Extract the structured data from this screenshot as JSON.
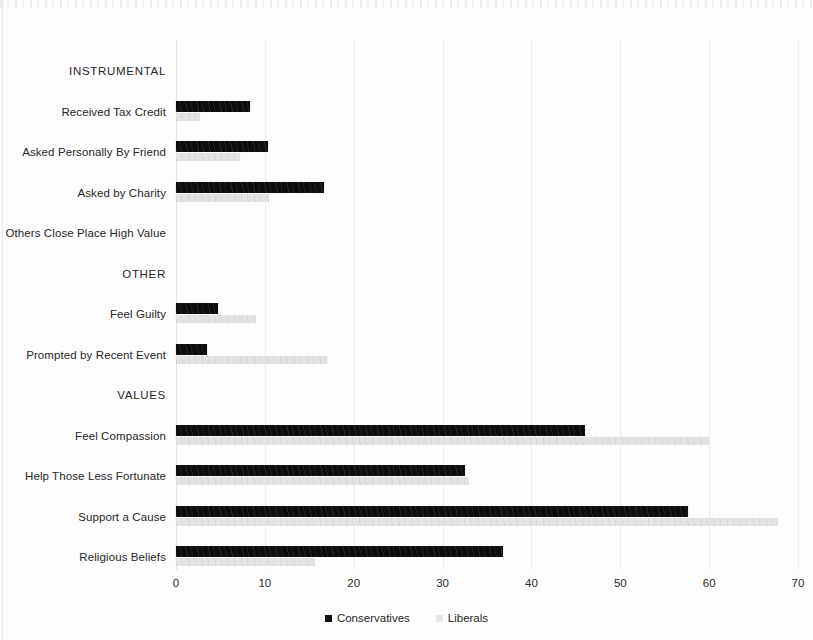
{
  "chart_data": {
    "type": "bar",
    "orientation": "horizontal",
    "title": "",
    "subtitle": "",
    "xlabel": "",
    "ylabel": "",
    "xlim": [
      0,
      70
    ],
    "xticks": [
      0,
      10,
      20,
      30,
      40,
      50,
      60,
      70
    ],
    "xtick_labels": [
      "0",
      "10",
      "20",
      "30",
      "40",
      "50",
      "60",
      "70"
    ],
    "grid": true,
    "grid_axis": "x",
    "legend_position": "bottom-center",
    "legend": [
      "Conservatives",
      "Liberals"
    ],
    "colors": {
      "conservatives": "#0d0d0d",
      "liberals": "#e3e3e3",
      "gridline": "#ededed",
      "text": "#262626",
      "background": "#fdfdfd"
    },
    "categories": [
      "INSTRUMENTAL",
      "Received Tax Credit",
      "Asked Personally By Friend",
      "Asked by Charity",
      "Others Close Place High Value",
      "OTHER",
      "Feel Guilty",
      "Prompted by Recent Event",
      "VALUES",
      "Feel Compassion",
      "Help Those Less Fortunate",
      "Support a Cause",
      "Religious Beliefs"
    ],
    "category_is_group_header": [
      true,
      false,
      false,
      false,
      false,
      true,
      false,
      false,
      true,
      false,
      false,
      false,
      false
    ],
    "series": [
      {
        "name": "Conservatives",
        "color": "#0d0d0d",
        "values": [
          null,
          8.3,
          10.3,
          16.7,
          0,
          null,
          4.7,
          3.5,
          null,
          46.0,
          32.5,
          57.6,
          36.8
        ]
      },
      {
        "name": "Liberals",
        "color": "#e3e3e3",
        "values": [
          null,
          2.7,
          7.2,
          10.5,
          0,
          null,
          9.0,
          17.0,
          null,
          60.0,
          33.0,
          67.7,
          15.6
        ]
      }
    ]
  },
  "rows": [
    {
      "label": "INSTRUMENTAL",
      "group": true,
      "cons": null,
      "lib": null
    },
    {
      "label": "Received Tax Credit",
      "group": false,
      "cons": 8.3,
      "lib": 2.7
    },
    {
      "label": "Asked Personally By Friend",
      "group": false,
      "cons": 10.3,
      "lib": 7.2
    },
    {
      "label": "Asked by Charity",
      "group": false,
      "cons": 16.7,
      "lib": 10.5
    },
    {
      "label": "Others Close Place High Value",
      "group": false,
      "cons": 0,
      "lib": 0
    },
    {
      "label": "OTHER",
      "group": true,
      "cons": null,
      "lib": null
    },
    {
      "label": "Feel Guilty",
      "group": false,
      "cons": 4.7,
      "lib": 9.0
    },
    {
      "label": "Prompted by Recent Event",
      "group": false,
      "cons": 3.5,
      "lib": 17.0
    },
    {
      "label": "VALUES",
      "group": true,
      "cons": null,
      "lib": null
    },
    {
      "label": "Feel Compassion",
      "group": false,
      "cons": 46.0,
      "lib": 60.0
    },
    {
      "label": "Help Those Less Fortunate",
      "group": false,
      "cons": 32.5,
      "lib": 33.0
    },
    {
      "label": "Support a Cause",
      "group": false,
      "cons": 57.6,
      "lib": 67.7
    },
    {
      "label": "Religious Beliefs",
      "group": false,
      "cons": 36.8,
      "lib": 15.6
    }
  ],
  "legend": {
    "items": [
      {
        "label": "Conservatives",
        "swatch": "cons"
      },
      {
        "label": "Liberals",
        "swatch": "lib"
      }
    ]
  },
  "axis": {
    "ticks": [
      "0",
      "10",
      "20",
      "30",
      "40",
      "50",
      "60",
      "70"
    ]
  }
}
